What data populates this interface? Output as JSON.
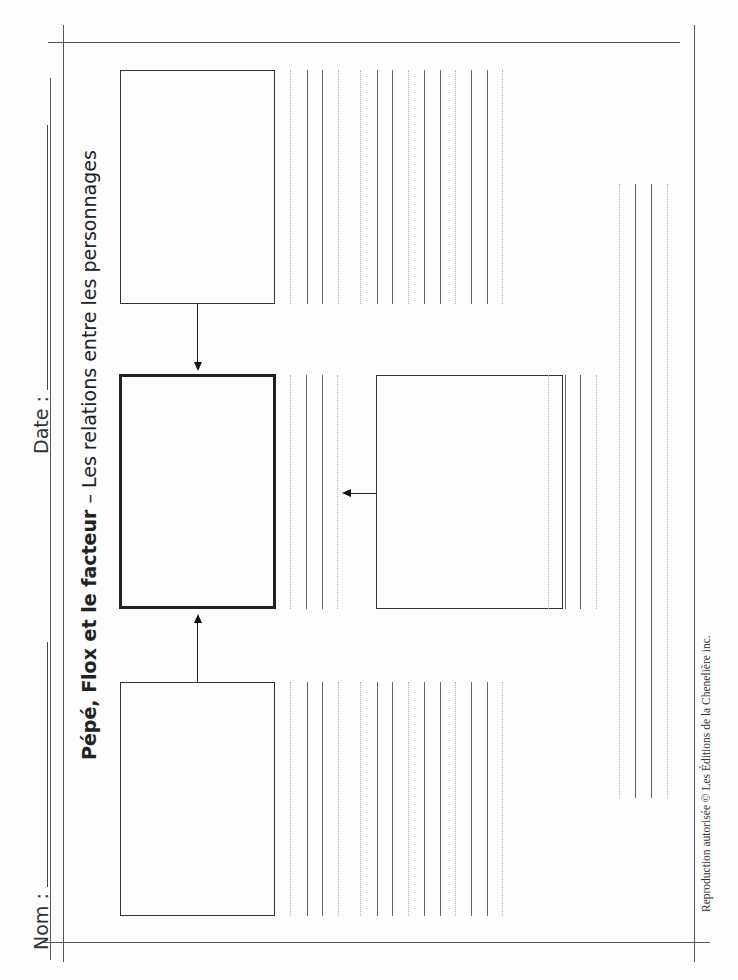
{
  "header": {
    "name_label": "Nom :",
    "date_label": "Date :"
  },
  "title": {
    "bold_part": "Pépé, Flox et le facteur",
    "separator": " – ",
    "regular_part": "Les relations entre les personnages"
  },
  "footer": {
    "copyright": "Reproduction autorisée © Les Éditions de la Chenelière inc."
  },
  "diagram": {
    "boxes": [
      {
        "id": "top-character",
        "emphasis": "normal"
      },
      {
        "id": "central-character",
        "emphasis": "bold"
      },
      {
        "id": "bottom-character",
        "emphasis": "normal"
      },
      {
        "id": "side-character",
        "emphasis": "normal"
      }
    ],
    "arrows": [
      {
        "from": "top-character",
        "to": "central-character",
        "direction": "down"
      },
      {
        "from": "bottom-character",
        "to": "central-character",
        "direction": "up"
      },
      {
        "from": "side-character",
        "to": "central-character",
        "direction": "left"
      }
    ],
    "writing_line_groups": 5
  }
}
